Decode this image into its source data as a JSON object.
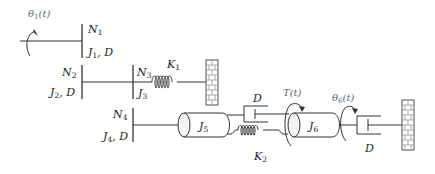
{
  "diagram": {
    "inputs": {
      "theta1": {
        "label": "θ",
        "sub": "1",
        "suffix": "(t)"
      },
      "torque": {
        "label": "T",
        "suffix": "(t)"
      },
      "theta6": {
        "label": "θ",
        "sub": "6",
        "suffix": "(t)"
      }
    },
    "gears": [
      {
        "id": "N1",
        "label": "N",
        "sub": "1"
      },
      {
        "id": "N2",
        "label": "N",
        "sub": "2"
      },
      {
        "id": "N3",
        "label": "N",
        "sub": "3"
      },
      {
        "id": "N4",
        "label": "N",
        "sub": "4"
      }
    ],
    "inertia_labels": {
      "j1d": {
        "j": "J",
        "sub": "1",
        "rest": ", D"
      },
      "j2d": {
        "j": "J",
        "sub": "2",
        "rest": ", D"
      },
      "j3": {
        "j": "J",
        "sub": "3"
      },
      "j4d": {
        "j": "J",
        "sub": "4",
        "rest": ", D"
      },
      "j5": {
        "j": "J",
        "sub": "5"
      },
      "j6": {
        "j": "J",
        "sub": "6"
      }
    },
    "springs": [
      {
        "id": "K1",
        "label": "K",
        "sub": "1"
      },
      {
        "id": "K2",
        "label": "K",
        "sub": "2"
      }
    ],
    "dampers": [
      {
        "id": "D_mid",
        "label": "D"
      },
      {
        "id": "D_right",
        "label": "D"
      }
    ]
  }
}
